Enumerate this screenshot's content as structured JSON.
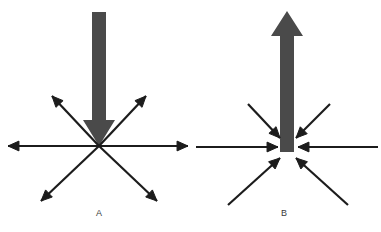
{
  "figure": {
    "width": 381,
    "height": 232,
    "background": "#ffffff"
  },
  "colors": {
    "thick_arrow": "#4a4a4a",
    "thin_arrow": "#1c1c1c",
    "label_text": "#3a3a3a",
    "background": "#ffffff"
  },
  "panels": [
    {
      "id": "A",
      "label": "A",
      "label_x": 99,
      "label_y": 216,
      "center": {
        "x": 99,
        "y": 146
      },
      "thick_arrow": {
        "name": "thick-down-arrow",
        "direction": "down",
        "shaft_x": 99,
        "shaft_top_y": 12,
        "shaft_bottom_y": 120,
        "shaft_width": 14,
        "head_width": 32,
        "head_tip_y": 146,
        "color": "#4a4a4a"
      },
      "thin_arrows_direction": "outward",
      "thin_arrows": [
        {
          "name": "thin-arrow-left",
          "x1": 99,
          "y1": 146,
          "x2": 8,
          "y2": 146
        },
        {
          "name": "thin-arrow-right",
          "x1": 99,
          "y1": 146,
          "x2": 188,
          "y2": 146
        },
        {
          "name": "thin-arrow-up-left",
          "x1": 99,
          "y1": 146,
          "x2": 52,
          "y2": 96
        },
        {
          "name": "thin-arrow-up-right",
          "x1": 99,
          "y1": 146,
          "x2": 146,
          "y2": 96
        },
        {
          "name": "thin-arrow-down-left",
          "x1": 99,
          "y1": 146,
          "x2": 41,
          "y2": 201
        },
        {
          "name": "thin-arrow-down-right",
          "x1": 99,
          "y1": 146,
          "x2": 157,
          "y2": 201
        }
      ]
    },
    {
      "id": "B",
      "label": "B",
      "label_x": 284,
      "label_y": 216,
      "center": {
        "x": 287,
        "y": 152
      },
      "thick_arrow": {
        "name": "thick-up-arrow",
        "direction": "up",
        "shaft_x": 287,
        "shaft_top_y": 36,
        "shaft_bottom_y": 152,
        "shaft_width": 14,
        "head_width": 32,
        "head_tip_y": 11,
        "color": "#4a4a4a"
      },
      "thin_arrows_direction": "inward",
      "thin_arrows": [
        {
          "name": "thin-arrow-from-left",
          "x1": 196,
          "y1": 147,
          "x2": 278,
          "y2": 147
        },
        {
          "name": "thin-arrow-from-right",
          "x1": 378,
          "y1": 147,
          "x2": 298,
          "y2": 147
        },
        {
          "name": "thin-arrow-from-up-left",
          "x1": 248,
          "y1": 104,
          "x2": 280,
          "y2": 138
        },
        {
          "name": "thin-arrow-from-up-right",
          "x1": 330,
          "y1": 104,
          "x2": 296,
          "y2": 138
        },
        {
          "name": "thin-arrow-from-down-left",
          "x1": 228,
          "y1": 205,
          "x2": 280,
          "y2": 158
        },
        {
          "name": "thin-arrow-from-down-right",
          "x1": 348,
          "y1": 205,
          "x2": 296,
          "y2": 158
        }
      ]
    }
  ]
}
